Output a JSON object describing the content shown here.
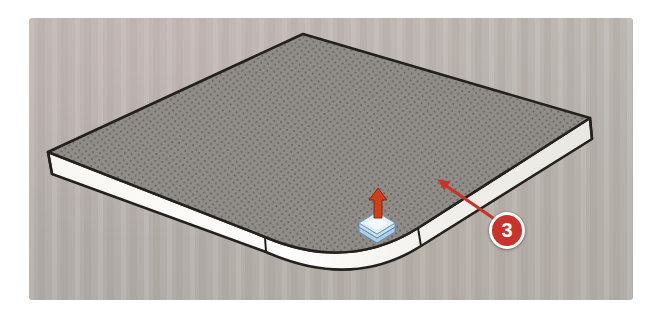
{
  "figure": {
    "kind": "instructional-3d-illustration",
    "callout": {
      "number": "3"
    }
  },
  "icons": {
    "push_pull_cursor": "push-pull-tool-cursor-icon",
    "callout_arrow": "callout-arrow-icon"
  },
  "colors": {
    "accent_red": "#c8342b",
    "cursor_arrow_red": "#d04018",
    "cursor_arrow_red_dark": "#7c200b",
    "slab_top": "#908d89",
    "slab_dot": "#514e49",
    "slab_side_light": "#f8f7f3",
    "slab_side": "#f1efea",
    "slab_side_dark": "#e7e5df",
    "outline": "#23201d",
    "paper_background": "#b6b1ac",
    "page_margin": "#ffffff",
    "cursor_blue_face": "#e3f0fa",
    "cursor_blue_side_upper": "#cbe1f2",
    "cursor_blue_side_lower": "#aecde6",
    "cursor_blue_stroke": "#5d88b8",
    "cursor_blue_sheen": "#f7fbfe"
  }
}
